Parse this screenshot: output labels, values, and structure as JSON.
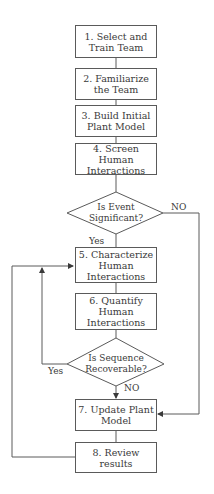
{
  "diagram": {
    "type": "flowchart",
    "steps": [
      {
        "id": "s1",
        "label": "1. Select and Train Team",
        "lines": [
          "1. Select and",
          "Train Team"
        ]
      },
      {
        "id": "s2",
        "label": "2. Familiarize the Team",
        "lines": [
          "2. Familiarize",
          "the Team"
        ]
      },
      {
        "id": "s3",
        "label": "3. Build Initial Plant Model",
        "lines": [
          "3. Build Initial",
          "Plant Model"
        ]
      },
      {
        "id": "s4",
        "label": "4. Screen Human Interactions",
        "lines": [
          "4. Screen Human",
          "Interactions"
        ]
      },
      {
        "id": "s5",
        "label": "5. Characterize Human Interactions",
        "lines": [
          "5. Characterize",
          "Human",
          "Interactions"
        ]
      },
      {
        "id": "s6",
        "label": "6. Quantify Human Interactions",
        "lines": [
          "6. Quantify",
          "Human",
          "Interactions"
        ]
      },
      {
        "id": "s7",
        "label": "7. Update Plant Model",
        "lines": [
          "7. Update Plant",
          "Model"
        ]
      },
      {
        "id": "s8",
        "label": "8. Review results",
        "lines": [
          "8. Review results"
        ]
      }
    ],
    "decisions": [
      {
        "id": "d1",
        "label": "Is Event Significant?",
        "lines": [
          "Is Event",
          "Significant?"
        ],
        "yes": "Yes",
        "no": "NO"
      },
      {
        "id": "d2",
        "label": "Is Sequence Recoverable?",
        "lines": [
          "Is Sequence",
          "Recoverable?"
        ],
        "yes": "Yes",
        "no": "NO"
      }
    ],
    "edges": [
      {
        "from": "s1",
        "to": "s2"
      },
      {
        "from": "s2",
        "to": "s3"
      },
      {
        "from": "s3",
        "to": "s4"
      },
      {
        "from": "s4",
        "to": "d1"
      },
      {
        "from": "d1",
        "to": "s5",
        "label": "Yes"
      },
      {
        "from": "d1",
        "to": "s7",
        "label": "NO"
      },
      {
        "from": "s5",
        "to": "s6"
      },
      {
        "from": "s6",
        "to": "d2"
      },
      {
        "from": "d2",
        "to": "s5",
        "label": "Yes"
      },
      {
        "from": "d2",
        "to": "s7",
        "label": "NO"
      },
      {
        "from": "s7",
        "to": "s8"
      },
      {
        "from": "s8",
        "to": "s5"
      }
    ],
    "colors": {
      "stroke": "#5a5a5a",
      "text": "#3a3a3a",
      "background": "#ffffff"
    }
  }
}
